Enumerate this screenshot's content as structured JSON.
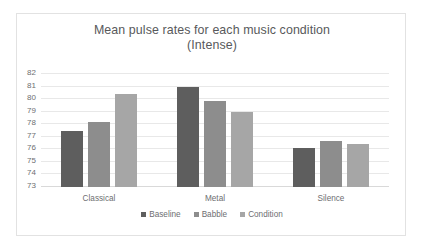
{
  "chart_data": {
    "type": "bar",
    "title": "Mean pulse rates for each music condition (Intense)",
    "title_lines": [
      "Mean pulse rates for each music condition",
      "(Intense)"
    ],
    "xlabel": "",
    "ylabel": "",
    "categories": [
      "Classical",
      "Metal",
      "Silence"
    ],
    "ylim": [
      73,
      82
    ],
    "ytick_labels": [
      "82",
      "81",
      "80",
      "79",
      "78",
      "77",
      "76",
      "75",
      "74",
      "73"
    ],
    "yticks": [
      82,
      81,
      80,
      79,
      78,
      77,
      76,
      75,
      74,
      73
    ],
    "grid": true,
    "legend_position": "bottom",
    "series": [
      {
        "name": "Baseline",
        "color": "#5e5e5e",
        "values": [
          77.5,
          81.0,
          76.1
        ]
      },
      {
        "name": "Babble",
        "color": "#8d8d8d",
        "values": [
          78.15,
          79.85,
          76.65
        ]
      },
      {
        "name": "Condition",
        "color": "#a6a6a6",
        "values": [
          80.4,
          79.0,
          76.45
        ]
      }
    ]
  },
  "style": {
    "text_color": "#6d6e71",
    "title_color": "#58595b",
    "grid_color": "#e8e8e8",
    "frame_color": "#e2e2e2",
    "background": "#ffffff"
  }
}
